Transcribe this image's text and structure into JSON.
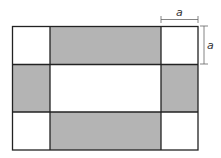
{
  "diagram": {
    "labels": {
      "top_dimension": "a",
      "right_dimension": "a"
    },
    "colors": {
      "shaded": "#b4b4b4",
      "unshaded": "#ffffff",
      "stroke": "#222222",
      "dimension_line": "#666666"
    },
    "grid": {
      "x": [
        12,
        50,
        161,
        198
      ],
      "y": [
        26,
        64,
        112,
        150
      ]
    },
    "cells": [
      {
        "row": 0,
        "col": 0,
        "shaded": false,
        "name": "corner-top-left"
      },
      {
        "row": 0,
        "col": 1,
        "shaded": true,
        "name": "edge-top"
      },
      {
        "row": 0,
        "col": 2,
        "shaded": false,
        "name": "corner-top-right"
      },
      {
        "row": 1,
        "col": 0,
        "shaded": true,
        "name": "edge-left"
      },
      {
        "row": 1,
        "col": 1,
        "shaded": false,
        "name": "center"
      },
      {
        "row": 1,
        "col": 2,
        "shaded": true,
        "name": "edge-right"
      },
      {
        "row": 2,
        "col": 0,
        "shaded": false,
        "name": "corner-bottom-left"
      },
      {
        "row": 2,
        "col": 1,
        "shaded": true,
        "name": "edge-bottom"
      },
      {
        "row": 2,
        "col": 2,
        "shaded": false,
        "name": "corner-bottom-right"
      }
    ]
  }
}
